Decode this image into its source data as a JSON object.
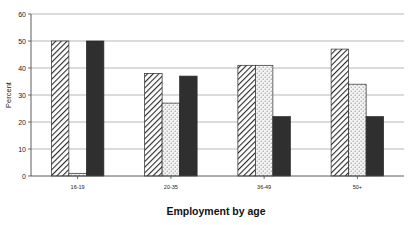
{
  "chart_data": {
    "type": "bar",
    "title": "",
    "xlabel": "Employment by age",
    "ylabel": "Percent",
    "categories": [
      "16-19",
      "20-35",
      "36-49",
      "50+"
    ],
    "series": [
      {
        "name": "series-1-diagonal-hatch",
        "values": [
          50,
          38,
          41,
          47
        ],
        "fill": "diagonal-hatch"
      },
      {
        "name": "series-2-dotted",
        "values": [
          1,
          27,
          41,
          34
        ],
        "fill": "dotted"
      },
      {
        "name": "series-3-solid-dark",
        "values": [
          50,
          37,
          22,
          22
        ],
        "fill": "solid-dark"
      }
    ],
    "ylim": [
      0,
      60
    ],
    "yticks": [
      0,
      10,
      20,
      30,
      40,
      50,
      60
    ],
    "ytick_labels": [
      "0",
      "10",
      "20",
      "30",
      "40",
      "50",
      "60"
    ],
    "grid": true,
    "grid_axis": "y",
    "legend": "none",
    "colors": {
      "solid_dark": "#2f2f2f",
      "hatch_stroke": "#2a2a2a",
      "dot_fill": "#f2f2f2",
      "grid": "#9a9a9a",
      "axis": "#4a4a4a",
      "text": "#1a1a1a"
    }
  }
}
